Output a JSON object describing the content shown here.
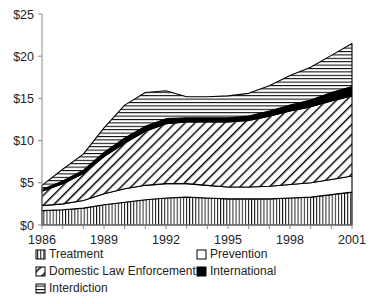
{
  "chart_data": {
    "type": "area",
    "stacked": true,
    "title": "",
    "subtitle": "",
    "xlabel": "",
    "ylabel": "",
    "x": [
      1986,
      1987,
      1988,
      1989,
      1990,
      1991,
      1992,
      1993,
      1994,
      1995,
      1996,
      1997,
      1998,
      1999,
      2000,
      2001
    ],
    "xtick_labels": [
      "1986",
      "1989",
      "1992",
      "1995",
      "1998",
      "2001"
    ],
    "xtick_values": [
      1986,
      1989,
      1992,
      1995,
      1998,
      2001
    ],
    "xlim": [
      1986,
      2001
    ],
    "ylim": [
      0,
      25
    ],
    "ytick_labels": [
      "$0",
      "$5",
      "$10",
      "$15",
      "$20",
      "$25"
    ],
    "ytick_values": [
      0,
      5,
      10,
      15,
      20,
      25
    ],
    "grid": false,
    "legend_position": "bottom",
    "units": "billions of dollars",
    "series": [
      {
        "name": "Treatment",
        "pattern": "vertical-lines",
        "values": [
          1.7,
          1.8,
          2.0,
          2.4,
          2.7,
          3.0,
          3.2,
          3.3,
          3.2,
          3.1,
          3.1,
          3.1,
          3.2,
          3.3,
          3.6,
          3.9
        ]
      },
      {
        "name": "Prevention",
        "pattern": "white",
        "values": [
          0.6,
          0.7,
          0.9,
          1.3,
          1.6,
          1.7,
          1.7,
          1.6,
          1.5,
          1.4,
          1.4,
          1.5,
          1.6,
          1.7,
          1.8,
          1.9
        ]
      },
      {
        "name": "Domestic Law Enforcement",
        "pattern": "diagonal-hatch",
        "values": [
          1.7,
          2.4,
          3.2,
          4.4,
          5.4,
          6.4,
          7.1,
          7.3,
          7.5,
          7.7,
          7.9,
          8.3,
          8.7,
          9.0,
          9.3,
          9.5
        ]
      },
      {
        "name": "International",
        "pattern": "solid-black",
        "values": [
          0.2,
          0.3,
          0.4,
          0.5,
          0.6,
          0.6,
          0.6,
          0.5,
          0.5,
          0.5,
          0.5,
          0.6,
          0.7,
          0.8,
          1.0,
          1.1
        ]
      },
      {
        "name": "Interdiction",
        "pattern": "horizontal-lines",
        "values": [
          0.5,
          1.4,
          1.9,
          2.9,
          3.9,
          4.0,
          3.3,
          2.5,
          2.5,
          2.6,
          2.7,
          3.0,
          3.5,
          3.9,
          4.4,
          5.1
        ]
      }
    ],
    "totals": [
      4.7,
      6.6,
      8.4,
      11.5,
      14.2,
      15.7,
      15.9,
      15.2,
      15.2,
      15.3,
      15.6,
      16.5,
      17.7,
      18.7,
      20.1,
      21.5
    ]
  },
  "legend": {
    "entries": [
      {
        "label": "Treatment",
        "swatch": "vertical-lines"
      },
      {
        "label": "Prevention",
        "swatch": "white"
      },
      {
        "label": "Domestic Law Enforcement",
        "swatch": "diagonal-hatch"
      },
      {
        "label": "International",
        "swatch": "solid-black"
      },
      {
        "label": "Interdiction",
        "swatch": "horizontal-lines"
      }
    ]
  },
  "colors": {
    "ink": "#000000",
    "axis": "#8a8a8a",
    "text": "#232323",
    "background": "#ffffff"
  }
}
